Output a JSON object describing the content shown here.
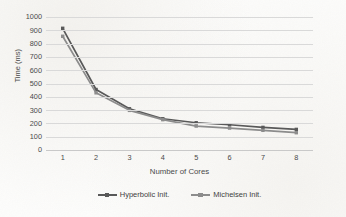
{
  "chart_data": {
    "type": "line",
    "title": "",
    "xlabel": "Number of Cores",
    "ylabel": "Time (ms)",
    "categories": [
      "1",
      "2",
      "3",
      "4",
      "5",
      "6",
      "7",
      "8"
    ],
    "x": [
      1,
      2,
      3,
      4,
      5,
      6,
      7,
      8
    ],
    "ylim": [
      0,
      1000
    ],
    "ytick_labels": [
      "1000",
      "900",
      "800",
      "700",
      "600",
      "500",
      "400",
      "300",
      "200",
      "100",
      "0"
    ],
    "ytick_values": [
      1000,
      900,
      800,
      700,
      600,
      500,
      400,
      300,
      200,
      100,
      0
    ],
    "grid": "horizontal",
    "legend_position": "bottom-center",
    "series": [
      {
        "name": "Hyperbolic Init.",
        "color": "#595959",
        "marker": "square",
        "values": [
          915,
          455,
          310,
          235,
          205,
          190,
          170,
          155
        ]
      },
      {
        "name": "Michelsen Init.",
        "color": "#8c8c8c",
        "marker": "square",
        "values": [
          855,
          430,
          298,
          228,
          180,
          165,
          148,
          130
        ]
      }
    ]
  },
  "colors": {
    "gridline": "#d9d9d9",
    "text": "#4a4a4a",
    "background": "#fdfdfc"
  }
}
